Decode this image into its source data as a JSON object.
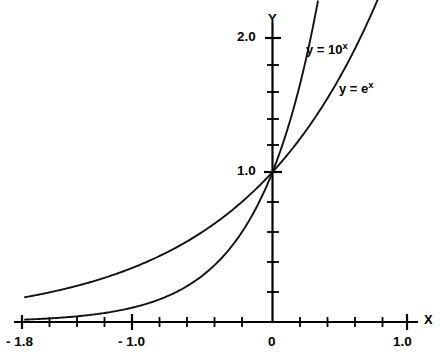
{
  "figure": {
    "background_color": "#ffffff",
    "ink_color": "#000000"
  },
  "axes": {
    "x_axis_label": "X",
    "y_axis_label": "Y",
    "x_tick_labels": [
      "- 1.8",
      "- 1.0",
      "0",
      "1.0"
    ],
    "y_tick_labels": [
      "2.0",
      "1.0"
    ]
  },
  "curve_labels": {
    "ten_to_x": {
      "prefix": "y = 10",
      "exponent": "x"
    },
    "e_to_x": {
      "prefix": "y = e",
      "exponent": "x"
    }
  },
  "chart_data": {
    "type": "line",
    "title": "",
    "subtitle": "",
    "xlabel": "X",
    "ylabel": "Y",
    "xlim": [
      -1.8,
      1.0
    ],
    "ylim": [
      0,
      2.15
    ],
    "grid": false,
    "legend": "inline-curve-labels",
    "xticks": [
      -1.8,
      -1.6,
      -1.4,
      -1.2,
      -1.0,
      -0.8,
      -0.6,
      -0.4,
      -0.2,
      0,
      0.2,
      0.4,
      0.6,
      0.8,
      1.0
    ],
    "xtick_labels": {
      "-1.8": "- 1.8",
      "-1.0": "- 1.0",
      "0": "0",
      "1.0": "1.0"
    },
    "yticks": [
      0,
      0.2,
      0.4,
      0.6,
      0.8,
      1.0,
      1.2,
      1.4,
      1.6,
      1.8,
      2.0
    ],
    "ytick_labels": {
      "1.0": "1.0",
      "2.0": "2.0"
    },
    "annotations": [
      {
        "text": "y = 10^x",
        "x": 0.25,
        "y": 1.88
      },
      {
        "text": "y = e^x",
        "x": 0.49,
        "y": 1.62
      }
    ],
    "series": [
      {
        "name": "y = 10^x",
        "expression": "10**x",
        "x": [
          -1.8,
          -1.6,
          -1.4,
          -1.2,
          -1.0,
          -0.8,
          -0.6,
          -0.4,
          -0.2,
          0,
          0.1,
          0.2,
          0.3,
          0.33
        ],
        "values": [
          0.0158,
          0.0251,
          0.0398,
          0.0631,
          0.1,
          0.1585,
          0.2512,
          0.3981,
          0.631,
          1.0,
          1.2589,
          1.5849,
          1.9953,
          2.138
        ]
      },
      {
        "name": "y = e^x",
        "expression": "exp(x)",
        "x": [
          -1.8,
          -1.6,
          -1.4,
          -1.2,
          -1.0,
          -0.8,
          -0.6,
          -0.4,
          -0.2,
          0,
          0.2,
          0.4,
          0.6,
          0.7,
          0.765
        ],
        "values": [
          0.1653,
          0.2019,
          0.2466,
          0.3012,
          0.3679,
          0.4493,
          0.5488,
          0.6703,
          0.8187,
          1.0,
          1.2214,
          1.4918,
          1.8221,
          2.0138,
          2.1491
        ]
      }
    ]
  }
}
